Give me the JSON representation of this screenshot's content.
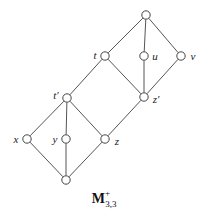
{
  "figure": {
    "caption": {
      "base": "M",
      "superscript": "+",
      "subscript": "3,3",
      "full": "M+3,3"
    },
    "style": {
      "edge_color": "#555555",
      "node_stroke": "#444444",
      "node_fill": "#ffffff",
      "label_color": "#1a1a1a",
      "background": "#ffffff",
      "edge_width": 1,
      "node_radius": 4.2
    }
  },
  "chart_data": {
    "type": "diagram",
    "title": "M+3,3",
    "nodes": [
      {
        "id": "top",
        "label": "",
        "x": 146,
        "y": 15,
        "label_x": 146,
        "label_y": 15,
        "labelled": false
      },
      {
        "id": "t",
        "label": "t",
        "x": 105,
        "y": 56,
        "label_x": 95,
        "label_y": 55,
        "labelled": true
      },
      {
        "id": "u",
        "label": "u",
        "x": 144,
        "y": 56,
        "label_x": 155,
        "label_y": 56,
        "labelled": true
      },
      {
        "id": "v",
        "label": "v",
        "x": 181,
        "y": 56,
        "label_x": 193,
        "label_y": 56,
        "labelled": true
      },
      {
        "id": "tprime",
        "label": "t′",
        "x": 67,
        "y": 98,
        "label_x": 56,
        "label_y": 95,
        "labelled": true
      },
      {
        "id": "zprime",
        "label": "z′",
        "x": 144,
        "y": 97,
        "label_x": 156,
        "label_y": 99,
        "labelled": true
      },
      {
        "id": "x",
        "label": "x",
        "x": 27,
        "y": 139,
        "label_x": 16,
        "label_y": 139,
        "labelled": true
      },
      {
        "id": "y",
        "label": "y",
        "x": 66,
        "y": 139,
        "label_x": 55,
        "label_y": 139,
        "labelled": true
      },
      {
        "id": "z",
        "label": "z",
        "x": 105,
        "y": 139,
        "label_x": 117,
        "label_y": 141,
        "labelled": true
      },
      {
        "id": "bottom",
        "label": "",
        "x": 66,
        "y": 180,
        "label_x": 66,
        "label_y": 180,
        "labelled": false
      }
    ],
    "edges": [
      [
        "top",
        "t"
      ],
      [
        "top",
        "u"
      ],
      [
        "top",
        "v"
      ],
      [
        "t",
        "zprime"
      ],
      [
        "u",
        "zprime"
      ],
      [
        "v",
        "zprime"
      ],
      [
        "t",
        "tprime"
      ],
      [
        "tprime",
        "x"
      ],
      [
        "tprime",
        "y"
      ],
      [
        "tprime",
        "z"
      ],
      [
        "z",
        "zprime"
      ],
      [
        "x",
        "bottom"
      ],
      [
        "y",
        "bottom"
      ],
      [
        "z",
        "bottom"
      ]
    ]
  }
}
